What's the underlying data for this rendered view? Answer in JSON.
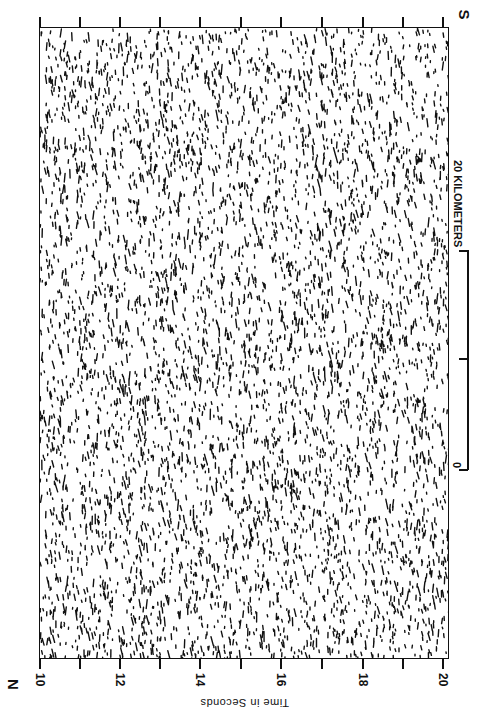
{
  "figure": {
    "end_labels": {
      "left": "N",
      "right": "S"
    },
    "x_axis": {
      "title": "Time in Seconds",
      "ticks": [
        {
          "value": "10",
          "x": 39,
          "labeled": true
        },
        {
          "value": "11",
          "x": 79,
          "labeled": false
        },
        {
          "value": "12",
          "x": 119,
          "labeled": true
        },
        {
          "value": "13",
          "x": 159,
          "labeled": false
        },
        {
          "value": "14",
          "x": 199,
          "labeled": true
        },
        {
          "value": "15",
          "x": 240,
          "labeled": false
        },
        {
          "value": "16",
          "x": 280,
          "labeled": true
        },
        {
          "value": "17",
          "x": 321,
          "labeled": false
        },
        {
          "value": "18",
          "x": 362,
          "labeled": true
        },
        {
          "value": "19",
          "x": 402,
          "labeled": false
        },
        {
          "value": "20",
          "x": 442,
          "labeled": true
        }
      ]
    },
    "scale_bar": {
      "label": "20 KILOMETERS",
      "zero_label": "0",
      "mid_tick": true,
      "units": "km",
      "length_km": 20
    },
    "texture": {
      "seed": 7,
      "count": 5200,
      "ink": "#111111",
      "paper": "#ffffff"
    }
  },
  "chart_data": {
    "type": "heatmap",
    "title": "",
    "xlabel": "Time in Seconds",
    "ylabel": "",
    "xlim": [
      10,
      20
    ],
    "x_tick_labels": [
      "10",
      "12",
      "14",
      "16",
      "18",
      "20"
    ],
    "minor_ticks_every": 1,
    "end_labels": [
      "N",
      "S"
    ],
    "scale_bar": {
      "label": "20 KILOMETERS",
      "from": 0,
      "to": 20,
      "mid_tick": 10
    },
    "grid": false,
    "legend": null
  }
}
